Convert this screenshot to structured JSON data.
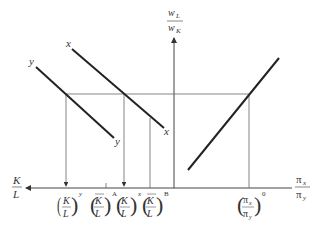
{
  "diagram": {
    "vertical_axis_label": {
      "numerator": "w",
      "numerator_sub": "L",
      "denominator": "w",
      "denominator_sub": "K"
    },
    "left_axis_label": {
      "numerator": "K",
      "denominator": "L"
    },
    "right_axis_label": {
      "numerator": "π",
      "numerator_sub": "x",
      "denominator": "π",
      "denominator_sub": "y"
    },
    "curves": [
      {
        "name": "y",
        "label_start": "y",
        "label_end": "y"
      },
      {
        "name": "x",
        "label_start": "x",
        "label_end": "x"
      }
    ],
    "ticks": [
      {
        "num": "K",
        "den": "L",
        "sup": "y",
        "bar": false
      },
      {
        "num": "K",
        "den": "L",
        "sup": "A",
        "bar": true
      },
      {
        "num": "K",
        "den": "L",
        "sup": "x",
        "bar": false
      },
      {
        "num": "K",
        "den": "L",
        "sup": "B",
        "bar": true
      }
    ],
    "price_tick": {
      "num": "π",
      "num_sub": "x",
      "den": "π",
      "den_sub": "y",
      "sup": "0"
    },
    "colors": {
      "line": "#222222",
      "guide": "#666666"
    }
  }
}
